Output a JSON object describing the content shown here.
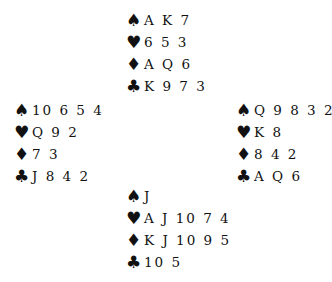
{
  "suits": {
    "spades": "♠",
    "hearts": "♥",
    "diamonds": "♦",
    "clubs": "♣"
  },
  "hands": {
    "north": {
      "spades": "A K 7",
      "hearts": "6 5 3",
      "diamonds": "A Q 6",
      "clubs": "K 9 7 3"
    },
    "west": {
      "spades": "10 6 5 4",
      "hearts": "Q 9 2",
      "diamonds": "7 3",
      "clubs": "J 8 4 2"
    },
    "east": {
      "spades": "Q 9 8 3 2",
      "hearts": "K 8",
      "diamonds": "8 4 2",
      "clubs": "A Q 6"
    },
    "south": {
      "spades": "J",
      "hearts": "A J 10 7 4",
      "diamonds": "K J 10 9 5",
      "clubs": "10 5"
    }
  }
}
